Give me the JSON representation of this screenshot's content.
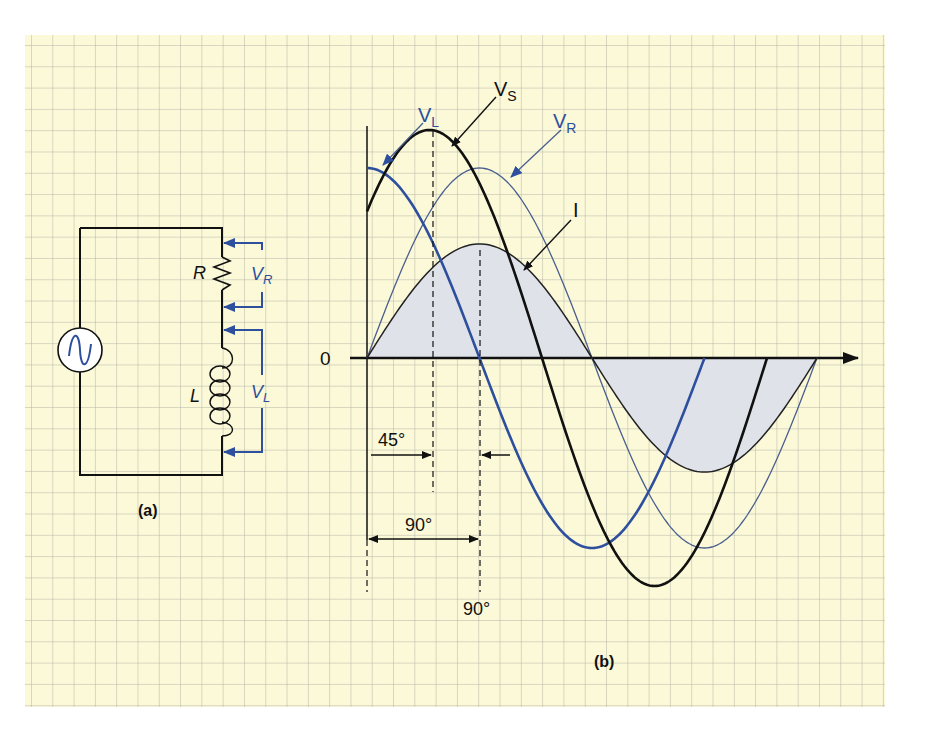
{
  "colors": {
    "paper": "#fbf9d8",
    "grid": "#b9b9ad",
    "black": "#111111",
    "blue": "#2d4f9e",
    "thin_blue": "#4a5f8f",
    "fill": "#dfe2e8"
  },
  "circuit": {
    "caption": "(a)",
    "labels": {
      "resistor": "R",
      "inductor": "L",
      "vr": "V",
      "vr_sub": "R",
      "vl": "V",
      "vl_sub": "L"
    },
    "source_icon": "ac-source-icon"
  },
  "waveform": {
    "caption": "(b)",
    "zero_label": "0",
    "labels": {
      "vs": "V",
      "vs_sub": "S",
      "vl": "V",
      "vl_sub": "L",
      "vr": "V",
      "vr_sub": "R",
      "i": "I"
    },
    "angle_labels": {
      "lead45": "45°",
      "span90": "90°",
      "mark90": "90°"
    }
  },
  "chart_data": {
    "type": "line",
    "xlabel": "",
    "ylabel": "",
    "x_unit": "degrees",
    "series": [
      {
        "name": "V_S",
        "amplitude": 1.2,
        "phase_lead_deg": 40,
        "color": "#111111",
        "x_start_deg": 0,
        "x_end_deg": 320
      },
      {
        "name": "V_R",
        "amplitude": 1.0,
        "phase_lead_deg": 0,
        "color": "#4a5f8f",
        "x_start_deg": 0,
        "x_end_deg": 360
      },
      {
        "name": "V_L",
        "amplitude": 1.0,
        "phase_lead_deg": 90,
        "color": "#2d4f9e",
        "x_start_deg": 0,
        "x_end_deg": 270
      },
      {
        "name": "I",
        "amplitude": 0.6,
        "phase_lead_deg": 0,
        "color": "#111111",
        "filled": true,
        "x_start_deg": 0,
        "x_end_deg": 360
      }
    ],
    "annotations": [
      "45°",
      "90°",
      "90°"
    ]
  }
}
